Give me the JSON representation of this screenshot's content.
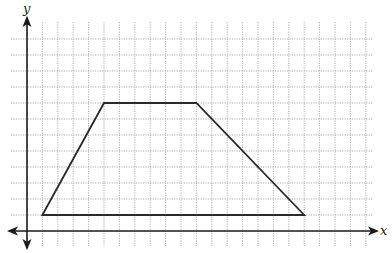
{
  "chart_data": {
    "type": "diagram",
    "title": "",
    "xlabel": "x",
    "ylabel": "y",
    "grid": true,
    "grid_x_range": [
      1,
      22
    ],
    "grid_y_range": [
      1,
      12
    ],
    "axes": {
      "x_arrows": "both",
      "y_arrows": "both"
    },
    "shape": {
      "name": "trapezoid",
      "vertices": [
        {
          "x": 1,
          "y": 1
        },
        {
          "x": 5,
          "y": 8
        },
        {
          "x": 11,
          "y": 8
        },
        {
          "x": 18,
          "y": 1
        }
      ],
      "closed": true
    }
  },
  "colors": {
    "grid": "#9a9a9a",
    "axis": "#1a1a1a",
    "shape": "#2a2a2a"
  }
}
